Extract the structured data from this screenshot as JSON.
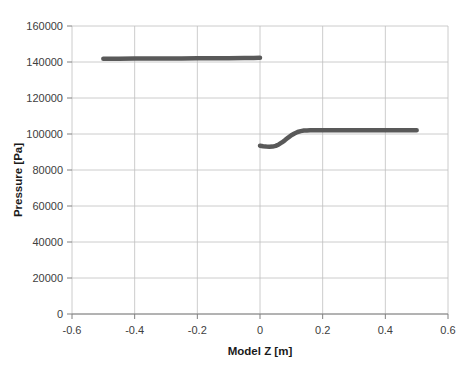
{
  "chart_data": {
    "type": "line",
    "title": "",
    "xlabel": "Model Z [m]",
    "ylabel": "Pressure [Pa]",
    "xlim": [
      -0.6,
      0.6
    ],
    "ylim": [
      0,
      160000
    ],
    "xticks": [
      "-0.6",
      "-0.4",
      "-0.2",
      "0",
      "0.2",
      "0.4",
      "0.6"
    ],
    "xtick_values": [
      -0.6,
      -0.4,
      -0.2,
      0,
      0.2,
      0.4,
      0.6
    ],
    "yticks": [
      "0",
      "20000",
      "40000",
      "60000",
      "80000",
      "100000",
      "120000",
      "140000",
      "160000"
    ],
    "ytick_values": [
      0,
      20000,
      40000,
      60000,
      80000,
      100000,
      120000,
      140000,
      160000
    ],
    "grid": true,
    "legend": "none",
    "line_color": "#595959",
    "grid_color": "#bfbfbf",
    "axis_color": "#808080",
    "series": [
      {
        "name": "Upstream pressure",
        "x": [
          -0.5,
          -0.45,
          -0.4,
          -0.35,
          -0.3,
          -0.25,
          -0.2,
          -0.15,
          -0.1,
          -0.05,
          -0.02,
          0.0
        ],
        "values": [
          141800,
          141850,
          141900,
          141950,
          142000,
          142000,
          142050,
          142100,
          142150,
          142200,
          142250,
          142300
        ]
      },
      {
        "name": "Downstream pressure",
        "x": [
          0.0,
          0.01,
          0.02,
          0.03,
          0.04,
          0.05,
          0.06,
          0.07,
          0.08,
          0.09,
          0.1,
          0.11,
          0.12,
          0.13,
          0.14,
          0.15,
          0.16,
          0.18,
          0.2,
          0.25,
          0.3,
          0.35,
          0.4,
          0.45,
          0.5
        ],
        "values": [
          93500,
          93200,
          93000,
          92900,
          93000,
          93400,
          94200,
          95300,
          96600,
          98000,
          99300,
          100300,
          101100,
          101600,
          101900,
          102000,
          102050,
          102100,
          102100,
          102100,
          102100,
          102100,
          102100,
          102100,
          102050
        ]
      }
    ]
  }
}
